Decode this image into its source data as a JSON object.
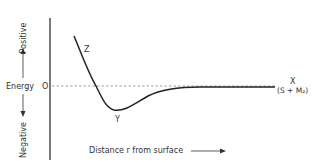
{
  "diagram": {
    "type": "potential-energy-curve",
    "y_axis": {
      "label": "Energy",
      "positive_label": "Positive",
      "negative_label": "Negative",
      "zero_label": "O"
    },
    "x_axis": {
      "label": "Distance r from surface"
    },
    "points": {
      "z": "Z",
      "y": "Y",
      "x": "X",
      "x_sub": "(S + M₂)"
    },
    "colors": {
      "curve": "#222222",
      "axis": "#222222",
      "zero_line": "#888888"
    }
  }
}
